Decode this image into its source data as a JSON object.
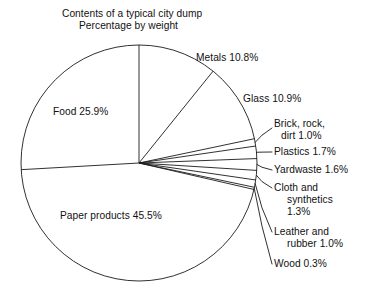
{
  "chart_data": {
    "type": "pie",
    "title": "Contents of a typical city dump",
    "subtitle": "Percentage by weight",
    "xlabel": "",
    "ylabel": "",
    "units": "percent by weight",
    "start_angle_deg": 90,
    "direction": "clockwise",
    "legend": "none-labels-on-slices-and-leaders",
    "grid": false,
    "categories": [
      "Metals",
      "Glass",
      "Brick, rock, dirt",
      "Plastics",
      "Yardwaste",
      "Cloth and synthetics",
      "Leather and rubber",
      "Wood",
      "Paper products",
      "Food"
    ],
    "values": [
      10.8,
      10.9,
      1.0,
      1.7,
      1.6,
      1.3,
      1.0,
      0.3,
      45.5,
      25.9
    ],
    "slices": [
      {
        "name": "Metals",
        "value": 10.8,
        "label": "Metals 10.8%",
        "label_lines": [
          "Metals 10.8%"
        ],
        "label_placement": "outside"
      },
      {
        "name": "Glass",
        "value": 10.9,
        "label": "Glass 10.9%",
        "label_lines": [
          "Glass 10.9%"
        ],
        "label_placement": "outside"
      },
      {
        "name": "Brick, rock, dirt",
        "value": 1.0,
        "label": "Brick, rock, dirt 1.0%",
        "label_lines": [
          "Brick, rock,",
          "  dirt 1.0%"
        ],
        "label_placement": "leader"
      },
      {
        "name": "Plastics",
        "value": 1.7,
        "label": "Plastics 1.7%",
        "label_lines": [
          "Plastics 1.7%"
        ],
        "label_placement": "leader"
      },
      {
        "name": "Yardwaste",
        "value": 1.6,
        "label": "Yardwaste 1.6%",
        "label_lines": [
          "Yardwaste 1.6%"
        ],
        "label_placement": "leader"
      },
      {
        "name": "Cloth and synthetics",
        "value": 1.3,
        "label": "Cloth and synthetics 1.3%",
        "label_lines": [
          "Cloth and",
          "  synthetics",
          "  1.3%"
        ],
        "label_placement": "leader"
      },
      {
        "name": "Leather and rubber",
        "value": 1.0,
        "label": "Leather and rubber 1.0%",
        "label_lines": [
          "Leather and",
          "  rubber 1.0%"
        ],
        "label_placement": "leader"
      },
      {
        "name": "Wood",
        "value": 0.3,
        "label": "Wood 0.3%",
        "label_lines": [
          "Wood 0.3%"
        ],
        "label_placement": "leader"
      },
      {
        "name": "Paper products",
        "value": 45.5,
        "label": "Paper products 45.5%",
        "label_lines": [
          "Paper products 45.5%"
        ],
        "label_placement": "inside"
      },
      {
        "name": "Food",
        "value": 25.9,
        "label": "Food 25.9%",
        "label_lines": [
          "Food 25.9%"
        ],
        "label_placement": "inside"
      }
    ],
    "total": 100.0,
    "colors": {
      "slice_fill": "#ffffff",
      "outline": "#1a1a1a",
      "text": "#111111",
      "background": "#ffffff"
    }
  },
  "labels": {
    "title_1": "Contents of a typical city dump",
    "title_2": "Percentage by weight",
    "metals": "Metals 10.8%",
    "glass": "Glass 10.9%",
    "brick_1": "Brick, rock,",
    "brick_2": "dirt 1.0%",
    "plastics": "Plastics 1.7%",
    "yardwaste": "Yardwaste 1.6%",
    "cloth_1": "Cloth and",
    "cloth_2": "synthetics",
    "cloth_3": "1.3%",
    "leather_1": "Leather and",
    "leather_2": "rubber 1.0%",
    "wood": "Wood 0.3%",
    "paper": "Paper products 45.5%",
    "food": "Food 25.9%"
  }
}
